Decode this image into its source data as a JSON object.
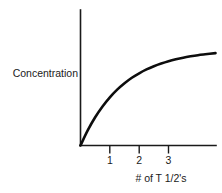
{
  "chart_data": {
    "type": "line",
    "title": "",
    "subtitle": "",
    "xlabel": "# of T 1/2's",
    "ylabel": "Concentration",
    "grid": false,
    "legend": false,
    "legend_position": "none",
    "axis_style": "open-L-axes-no-arrowheads",
    "xlim": [
      0,
      4.6
    ],
    "ylim": [
      0,
      1.08
    ],
    "xticks": [
      1,
      2,
      3
    ],
    "xtick_labels": [
      "1",
      "2",
      "3"
    ],
    "yticks": [],
    "ytick_labels": [],
    "annotations": [],
    "series": [
      {
        "name": "Concentration accumulation",
        "curve_model": "plateau: y = 1 - 2^(-x)",
        "x": [
          0,
          0.25,
          0.5,
          0.75,
          1,
          1.25,
          1.5,
          1.75,
          2,
          2.25,
          2.5,
          2.75,
          3,
          3.25,
          3.5,
          3.75,
          4,
          4.25,
          4.6
        ],
        "y": [
          0,
          0.159,
          0.293,
          0.405,
          0.5,
          0.58,
          0.646,
          0.703,
          0.75,
          0.79,
          0.823,
          0.851,
          0.875,
          0.895,
          0.912,
          0.926,
          0.938,
          0.947,
          0.959
        ]
      }
    ]
  },
  "labels": {
    "y_axis_title": "Concentration",
    "x_axis_title": "# of T 1/2's",
    "tick_1": "1",
    "tick_2": "2",
    "tick_3": "3"
  },
  "colors": {
    "background": "#ffffff",
    "axis": "#1a1a1a",
    "curve": "#0d0d0d",
    "text": "#1a1a1a"
  }
}
